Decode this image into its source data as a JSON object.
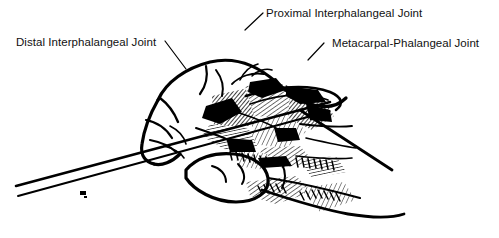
{
  "figure": {
    "kind": "anatomical-line-drawing",
    "background_color": "#ffffff",
    "ink_color": "#000000",
    "width": 499,
    "height": 238
  },
  "labels": {
    "distal": {
      "text": "Distal Interphalangeal Joint",
      "leader": "diagonal line from label right edge down-right to joint"
    },
    "proximal": {
      "text": "Proximal Interphalangeal Joint",
      "leader": "short diagonal line from label left edge down-left to knuckle apex"
    },
    "metacarpal": {
      "text": "Metacarpal-Phalangeal Joint",
      "leader": "short diagonal line from label left edge down-left to joint"
    }
  },
  "icons": {
    "leader_line": "leader-line"
  }
}
